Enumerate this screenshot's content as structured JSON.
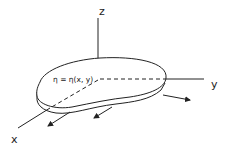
{
  "diagram": {
    "axes": {
      "x_label": "x",
      "y_label": "y",
      "z_label": "z"
    },
    "surface_equation": "η = η(x, y)",
    "colors": {
      "stroke": "#222222",
      "background": "#ffffff"
    },
    "arrows_count": 3
  }
}
